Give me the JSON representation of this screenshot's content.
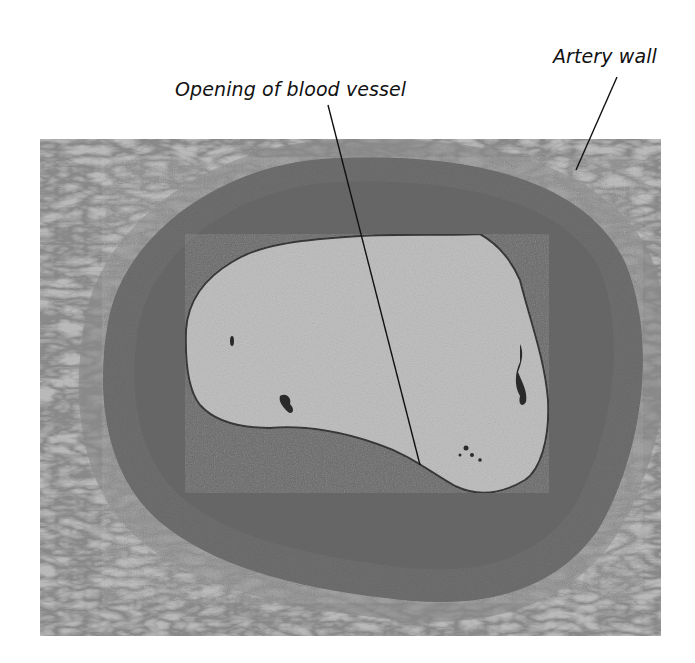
{
  "figure": {
    "labels": [
      {
        "id": "opening",
        "text": "Opening of blood vessel",
        "pointer_from": [
          328,
          105
        ],
        "pointer_to": [
          420,
          465
        ]
      },
      {
        "id": "artery",
        "text": "Artery wall",
        "pointer_from": [
          617,
          77
        ],
        "pointer_to": [
          576,
          170
        ]
      }
    ],
    "micrograph": {
      "bounds": {
        "x": 40,
        "y": 139,
        "width": 621,
        "height": 497
      },
      "colors": {
        "connective_tissue": "#b9b9b9",
        "adventitia_fibers": "#6a6a6a",
        "media_wall": "#707070",
        "media_dark": "#5d5d5d",
        "lumen": "#c2c2c2",
        "debris": "#2a2a2a"
      }
    }
  }
}
